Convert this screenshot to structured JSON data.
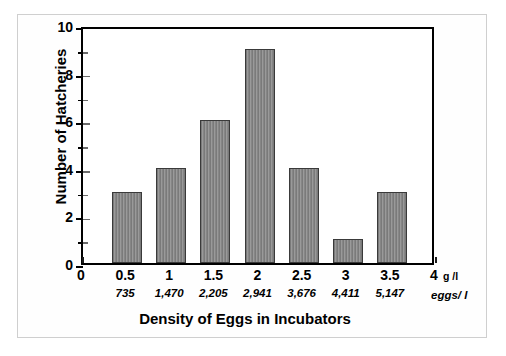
{
  "chart_data": {
    "type": "bar",
    "title": "",
    "xlabel": "Density of Eggs in Incubators",
    "ylabel": "Number of Hatcheries",
    "categories": [
      "0.5",
      "1",
      "1.5",
      "2",
      "2.5",
      "3",
      "3.5"
    ],
    "values": [
      3,
      4,
      6,
      9,
      4,
      1,
      3
    ],
    "xlim": [
      0,
      4
    ],
    "ylim": [
      0,
      10
    ],
    "grid": false,
    "legend": null,
    "x_axis": {
      "primary_unit": "g /l",
      "secondary_unit": "eggs/ l",
      "primary_ticks": [
        "0",
        "0.5",
        "1",
        "1.5",
        "2",
        "2.5",
        "3",
        "3.5",
        "4"
      ],
      "primary_tick_values": [
        0,
        0.5,
        1,
        1.5,
        2,
        2.5,
        3,
        3.5,
        4
      ],
      "secondary_ticks": [
        "735",
        "1,470",
        "2,205",
        "2,941",
        "3,676",
        "4,411",
        "5,147"
      ],
      "secondary_tick_values": [
        0.5,
        1,
        1.5,
        2,
        2.5,
        3,
        3.5
      ]
    },
    "y_axis": {
      "major_ticks": [
        "0",
        "2",
        "4",
        "6",
        "8",
        "10"
      ],
      "major_tick_values": [
        0,
        2,
        4,
        6,
        8,
        10
      ],
      "minor_tick_values": [
        1,
        3,
        5,
        7,
        9
      ]
    },
    "colors": {
      "bar_fill": "#8a8a8a",
      "bar_edge": "#3a3a3a",
      "axis": "#000000",
      "background": "#ffffff",
      "frame": "#cfcfcf"
    }
  }
}
